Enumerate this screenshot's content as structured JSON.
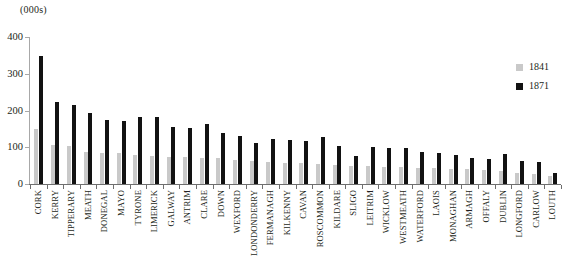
{
  "chart_data": {
    "type": "bar",
    "title": "",
    "unit_label": "(000s)",
    "xlabel": "",
    "ylabel": "",
    "ylim": [
      0,
      400
    ],
    "yticks": [
      0,
      100,
      200,
      300,
      400
    ],
    "ytick_labels": [
      "0",
      "100",
      "200",
      "300",
      "400"
    ],
    "grid": false,
    "legend_position": "right",
    "categories": [
      "CORK",
      "KERRY",
      "TIPPERARY",
      "MEATH",
      "DONEGAL",
      "MAYO",
      "TYRONE",
      "LIMERICK",
      "GALWAY",
      "ANTRIM",
      "CLARE",
      "DOWN",
      "WEXFORD",
      "LONDONDERRY",
      "FERMANAGH",
      "KILKENNY",
      "CAVAN",
      "ROSCOMMON",
      "KILDARE",
      "SLIGO",
      "LEITRIM",
      "WICKLOW",
      "WESTMEATH",
      "WATERFORD",
      "LAOIS",
      "MONAGHAN",
      "ARMAGH",
      "OFFALY",
      "DUBLIN",
      "LONGFORD",
      "CARLOW",
      "LOUTH"
    ],
    "series": [
      {
        "name": "1841",
        "color": "#c9c9c9",
        "values": [
          150,
          105,
          104,
          86,
          85,
          84,
          80,
          76,
          74,
          73,
          72,
          70,
          66,
          62,
          60,
          58,
          56,
          55,
          53,
          50,
          48,
          46,
          45,
          44,
          43,
          42,
          40,
          38,
          36,
          30,
          28,
          22
        ]
      },
      {
        "name": "1871",
        "color": "#121212",
        "values": [
          347,
          222,
          216,
          192,
          175,
          172,
          183,
          181,
          155,
          152,
          163,
          140,
          132,
          111,
          122,
          120,
          118,
          128,
          104,
          76,
          100,
          97,
          98,
          86,
          85,
          78,
          70,
          68,
          82,
          62,
          60,
          30
        ]
      }
    ]
  },
  "legend": {
    "items": [
      {
        "label": "1841",
        "color": "#c9c9c9"
      },
      {
        "label": "1871",
        "color": "#121212"
      }
    ]
  },
  "colors": {
    "series_1841": "#c9c9c9",
    "series_1871": "#121212",
    "axis": "#6f6f6f",
    "text": "#231f20",
    "background": "#ffffff"
  }
}
